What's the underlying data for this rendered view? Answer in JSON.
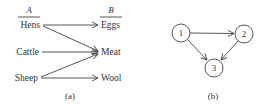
{
  "panel_a": {
    "caption": "(a)",
    "set_a": {
      "header": "A",
      "items": [
        "Hens",
        "Cattle",
        "Sheep"
      ]
    },
    "set_b": {
      "header": "B",
      "items": [
        "Eggs",
        "Meat",
        "Wool"
      ]
    },
    "relations": [
      {
        "from": "Hens",
        "to": "Eggs"
      },
      {
        "from": "Hens",
        "to": "Meat"
      },
      {
        "from": "Cattle",
        "to": "Meat"
      },
      {
        "from": "Sheep",
        "to": "Meat"
      },
      {
        "from": "Sheep",
        "to": "Wool"
      }
    ]
  },
  "panel_b": {
    "caption": "(b)",
    "nodes": [
      "1",
      "2",
      "3"
    ],
    "edges": [
      {
        "from": "1",
        "to": "2"
      },
      {
        "from": "1",
        "to": "3"
      },
      {
        "from": "2",
        "to": "3"
      }
    ]
  },
  "colors": {
    "ink": "#444444",
    "text": "#333333",
    "background": "#ffffff"
  }
}
